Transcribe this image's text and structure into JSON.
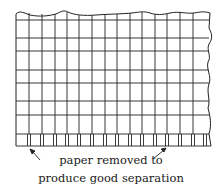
{
  "diagram": {
    "type": "graph-paper-sheet-with-perforated-tabs",
    "caption": {
      "line1": "paper removed to",
      "line2": "produce good separation"
    },
    "grid": {
      "columns": 16,
      "rows": 7,
      "tab_row": true
    },
    "colors": {
      "line": "#222222",
      "background": "#ffffff"
    }
  }
}
